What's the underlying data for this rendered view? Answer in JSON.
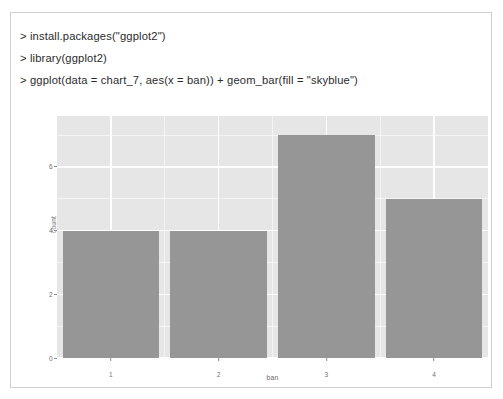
{
  "document": {
    "type": "scanned-page",
    "border_color": "#cfcfcf",
    "background": "#ffffff"
  },
  "console": {
    "prompt": ">",
    "lines": [
      "> install.packages(\"ggplot2\")",
      "> library(ggplot2)",
      "> ggplot(data = chart_7, aes(x = ban)) + geom_bar(fill = \"skyblue\")"
    ]
  },
  "chart_data": {
    "type": "bar",
    "title": "",
    "xlabel": "ban",
    "ylabel": "count",
    "categories": [
      "1",
      "2",
      "3",
      "4"
    ],
    "values": [
      4,
      4,
      7,
      5
    ],
    "ylim": [
      0,
      7.6
    ],
    "y_ticks": [
      0,
      2,
      4,
      6
    ],
    "y_tick_labels": [
      "0",
      "2",
      "4",
      "6"
    ],
    "y_minor_ticks": [
      1,
      3,
      5,
      7
    ],
    "x_tick_labels": [
      "1",
      "2",
      "3",
      "4"
    ],
    "grid": true,
    "legend": "none",
    "bar_fill_declared": "skyblue",
    "bar_fill_rendered": "#969696",
    "panel_background": "#e6e6e6",
    "gridline_color": "#ffffff",
    "axis_text_color": "#6f6f6f"
  }
}
